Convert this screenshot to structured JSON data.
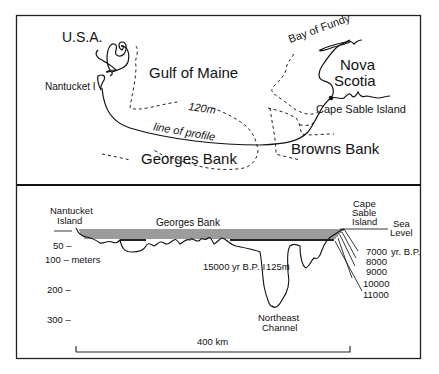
{
  "map": {
    "labels": {
      "usa": "U.S.A.",
      "nantucket": "Nantucket I",
      "gulf_of_maine": "Gulf of Maine",
      "bay_of_fundy": "Bay of Fundy",
      "nova": "Nova",
      "scotia": "Scotia",
      "contour": "120m",
      "line_of_profile": "line of profile",
      "cape_sable": "Cape Sable Island",
      "georges_bank": "Georges Bank",
      "browns_bank": "Browns Bank"
    }
  },
  "profile": {
    "labels": {
      "nantucket_1": "Nantucket",
      "nantucket_2": "Island",
      "georges_bank": "Georges Bank",
      "cape_1": "Cape",
      "cape_2": "Sable",
      "cape_3": "Island",
      "sea_1": "Sea",
      "sea_2": "Level",
      "age_15000": "15000 yr B.P.",
      "depth_125": "125m",
      "channel_1": "Northeast",
      "channel_2": "Channel",
      "scale": "400 km",
      "yr_bp": "yr. B.P."
    },
    "depth_axis": [
      {
        "label": "50 –",
        "value": 50
      },
      {
        "label": "100 – meters",
        "value": 100
      },
      {
        "label": "200 –",
        "value": 200
      },
      {
        "label": "300 –",
        "value": 300
      }
    ],
    "sea_levels": [
      {
        "label": "7000"
      },
      {
        "label": "8000"
      },
      {
        "label": "9000"
      },
      {
        "label": "10000"
      },
      {
        "label": "11000"
      }
    ]
  }
}
